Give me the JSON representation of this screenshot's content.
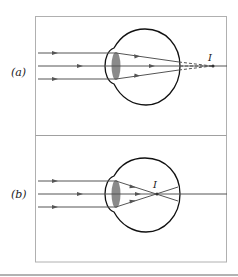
{
  "figure": {
    "panels": [
      {
        "id": "a",
        "label": "(a)",
        "focus_label": "I",
        "description": "Farsighted eye: parallel rays focus behind the retina"
      },
      {
        "id": "b",
        "label": "(b)",
        "focus_label": "I",
        "description": "Nearsighted eye: parallel rays focus in front of the retina"
      }
    ],
    "colors": {
      "frame": "#b0b0b0",
      "ray": "#555555",
      "eye_outline": "#111111",
      "lens": "#8a8a8a",
      "bottom_rule": "#999999"
    }
  }
}
